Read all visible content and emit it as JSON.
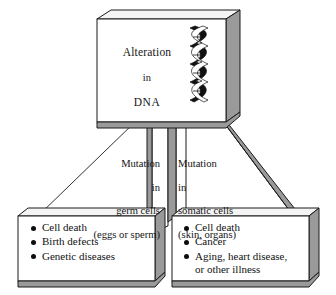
{
  "diagram": {
    "style": {
      "box_face": "#ffffff",
      "box_side": "#9a9a9a",
      "box_top": "#f2f2f2",
      "outline": "#1a1a1a",
      "background": "#ffffff",
      "bullet_color": "#0d0d0d"
    },
    "top_box": {
      "line1": "Alteration",
      "line2": "in",
      "line3": "DNA",
      "icon": "dna-double-helix-icon"
    },
    "branches": [
      {
        "id": "germ",
        "label_lines": [
          "Mutation",
          "in",
          "germ cells",
          "(eggs or sperm)"
        ],
        "align": "right",
        "outcomes": [
          {
            "text": "Cell death",
            "cont": ""
          },
          {
            "text": "Birth defects",
            "cont": ""
          },
          {
            "text": "Genetic diseases",
            "cont": ""
          }
        ]
      },
      {
        "id": "somatic",
        "label_lines": [
          "Mutation",
          "in",
          "somatic cells",
          "(skin, organs)"
        ],
        "align": "left",
        "outcomes": [
          {
            "text": "Cell death",
            "cont": ""
          },
          {
            "text": "Cancer",
            "cont": ""
          },
          {
            "text": "Aging, heart disease,",
            "cont": "or other illness"
          }
        ]
      }
    ]
  }
}
